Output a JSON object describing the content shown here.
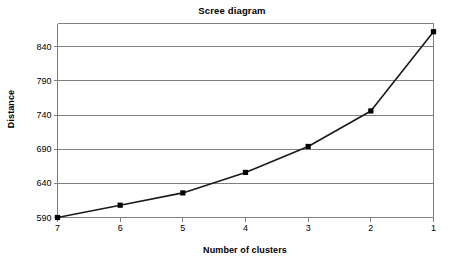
{
  "chart_data": {
    "type": "line",
    "title": "Scree diagram",
    "xlabel": "Number of clusters",
    "ylabel": "Distance",
    "x": [
      7,
      6,
      5,
      4,
      3,
      2,
      1
    ],
    "categories": [
      "7",
      "6",
      "5",
      "4",
      "3",
      "2",
      "1"
    ],
    "values": [
      590,
      608,
      626,
      656,
      694,
      746,
      862
    ],
    "series": [
      {
        "name": "Distance",
        "values": [
          590,
          608,
          626,
          656,
          694,
          746,
          862
        ]
      }
    ],
    "xtick_labels": [
      "7",
      "6",
      "5",
      "4",
      "3",
      "2",
      "1"
    ],
    "ytick_labels": [
      "590",
      "640",
      "690",
      "740",
      "790",
      "840"
    ],
    "yticks": [
      590,
      640,
      690,
      740,
      790,
      840
    ],
    "ylim": [
      590,
      874
    ],
    "xlim": [
      7,
      1
    ],
    "grid": "horizontal",
    "legend": "none",
    "marker": "square",
    "marker_color": "#000000",
    "line_color": "#1a1a1a",
    "gridline_color": "#808080",
    "axis_color": "#808080",
    "background_color": "#ffffff"
  },
  "figure": {
    "title": "Scree diagram",
    "x_axis_title": "Number of clusters",
    "y_axis_title": "Distance"
  }
}
